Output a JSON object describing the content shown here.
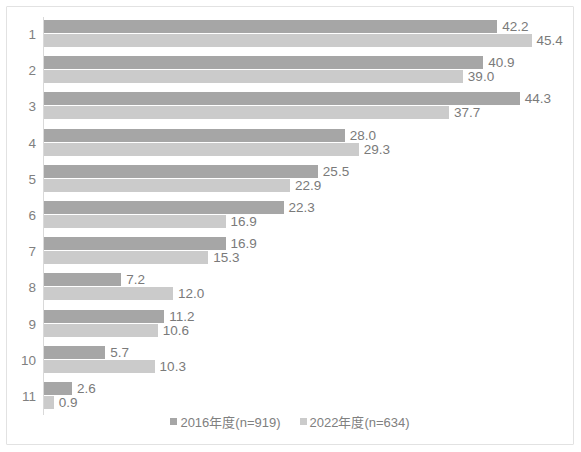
{
  "chart_data": {
    "type": "bar",
    "orientation": "horizontal",
    "title": "",
    "subtitle": "",
    "xlabel": "",
    "ylabel": "",
    "grid": false,
    "legend_position": "bottom",
    "xlim": [
      0,
      50
    ],
    "categories": [
      "1",
      "2",
      "3",
      "4",
      "5",
      "6",
      "7",
      "8",
      "9",
      "10",
      "11"
    ],
    "series": [
      {
        "name": "2016年度(n=919)",
        "color": "#a6a6a6",
        "values": [
          42.2,
          40.9,
          44.3,
          28.0,
          25.5,
          22.3,
          16.9,
          7.2,
          11.2,
          5.7,
          2.6
        ],
        "labels": [
          "42.2",
          "40.9",
          "44.3",
          "28.0",
          "25.5",
          "22.3",
          "16.9",
          "7.2",
          "11.2",
          "5.7",
          "2.6"
        ]
      },
      {
        "name": "2022年度(n=634)",
        "color": "#cbcbcb",
        "values": [
          45.4,
          39.0,
          37.7,
          29.3,
          22.9,
          16.9,
          15.3,
          12.0,
          10.6,
          10.3,
          0.9
        ],
        "labels": [
          "45.4",
          "39.0",
          "37.7",
          "29.3",
          "22.9",
          "16.9",
          "15.3",
          "12.0",
          "10.6",
          "10.3",
          "0.9"
        ]
      }
    ]
  },
  "legend": {
    "items": [
      {
        "label": "2016年度(n=919)"
      },
      {
        "label": "2022年度(n=634)"
      }
    ]
  }
}
